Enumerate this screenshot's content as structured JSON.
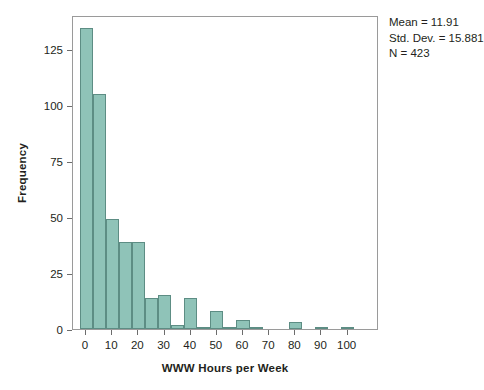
{
  "chart_data": {
    "type": "bar",
    "title": "",
    "subtitle": "",
    "xlabel": "WWW Hours per Week",
    "ylabel": "Frequency",
    "xlim": [
      -5,
      112
    ],
    "ylim": [
      0,
      140
    ],
    "grid": false,
    "legend_position": "none",
    "bin_width": 5,
    "x_ticks": [
      0,
      10,
      20,
      30,
      40,
      50,
      60,
      70,
      80,
      90,
      100
    ],
    "y_ticks": [
      0,
      25,
      50,
      75,
      100,
      125
    ],
    "bar_color": "#8fc3b8",
    "bar_edge_color": "#5d8d84",
    "bins": [
      {
        "start": -2.5,
        "end": 2.5,
        "center": 0,
        "value": 134
      },
      {
        "start": 2.5,
        "end": 7.5,
        "center": 5,
        "value": 105
      },
      {
        "start": 7.5,
        "end": 12.5,
        "center": 10,
        "value": 49
      },
      {
        "start": 12.5,
        "end": 17.5,
        "center": 15,
        "value": 39
      },
      {
        "start": 17.5,
        "end": 22.5,
        "center": 20,
        "value": 39
      },
      {
        "start": 22.5,
        "end": 27.5,
        "center": 25,
        "value": 14
      },
      {
        "start": 27.5,
        "end": 32.5,
        "center": 30,
        "value": 15
      },
      {
        "start": 32.5,
        "end": 37.5,
        "center": 35,
        "value": 2
      },
      {
        "start": 37.5,
        "end": 42.5,
        "center": 40,
        "value": 14
      },
      {
        "start": 42.5,
        "end": 47.5,
        "center": 45,
        "value": 1
      },
      {
        "start": 47.5,
        "end": 52.5,
        "center": 50,
        "value": 8
      },
      {
        "start": 52.5,
        "end": 57.5,
        "center": 55,
        "value": 1
      },
      {
        "start": 57.5,
        "end": 62.5,
        "center": 60,
        "value": 4
      },
      {
        "start": 62.5,
        "end": 67.5,
        "center": 65,
        "value": 1
      },
      {
        "start": 77.5,
        "end": 82.5,
        "center": 80,
        "value": 3
      },
      {
        "start": 87.5,
        "end": 92.5,
        "center": 90,
        "value": 1
      },
      {
        "start": 97.5,
        "end": 102.5,
        "center": 100,
        "value": 1
      }
    ],
    "annotations": {
      "mean": "Mean = 11.91",
      "std_dev": "Std. Dev. = 15.881",
      "n": "N = 423"
    }
  }
}
